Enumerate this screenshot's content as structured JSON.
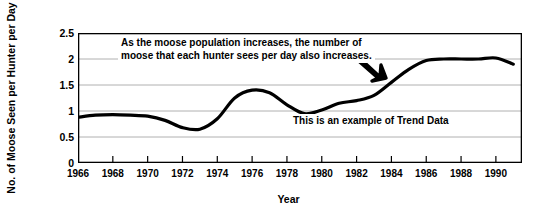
{
  "chart_data": {
    "type": "line",
    "title": "",
    "xlabel": "Year",
    "ylabel": "No. of Moose Seen per Hunter per Day",
    "xlim": [
      1966,
      1991.5
    ],
    "ylim": [
      0,
      2.5
    ],
    "grid": true,
    "legend": "none",
    "y_ticks": [
      "0",
      "0.5",
      "1",
      "1.5",
      "2",
      "2.5"
    ],
    "y_tick_values": [
      0,
      0.5,
      1,
      1.5,
      2,
      2.5
    ],
    "x_ticks": [
      "1966",
      "1968",
      "1970",
      "1972",
      "1974",
      "1976",
      "1978",
      "1980",
      "1982",
      "1984",
      "1986",
      "1988",
      "1990"
    ],
    "x_tick_values": [
      1966,
      1968,
      1970,
      1972,
      1974,
      1976,
      1978,
      1980,
      1982,
      1984,
      1986,
      1988,
      1990
    ],
    "series": [
      {
        "name": "Moose seen per hunter per day",
        "color": "#000000",
        "x": [
          1966,
          1967,
          1968,
          1969,
          1970,
          1971,
          1972,
          1973,
          1974,
          1975,
          1976,
          1977,
          1978,
          1979,
          1980,
          1981,
          1982,
          1983,
          1984,
          1985,
          1986,
          1987,
          1988,
          1989,
          1990,
          1991
        ],
        "values": [
          0.88,
          0.92,
          0.93,
          0.92,
          0.9,
          0.82,
          0.68,
          0.65,
          0.85,
          1.25,
          1.4,
          1.35,
          1.12,
          0.95,
          1.02,
          1.15,
          1.2,
          1.3,
          1.55,
          1.8,
          1.97,
          2.0,
          2.0,
          2.0,
          2.02,
          1.9
        ]
      }
    ],
    "annotations": [
      {
        "id": "trend-explanation",
        "text": "As the moose population increases, the number of\nmoose that each hunter sees per day also increases."
      },
      {
        "id": "trend-data-caption",
        "text": "This is an example of Trend Data"
      }
    ],
    "arrow": {
      "id": "pointer-arrow",
      "direction": "down-right",
      "color": "#000000"
    }
  }
}
